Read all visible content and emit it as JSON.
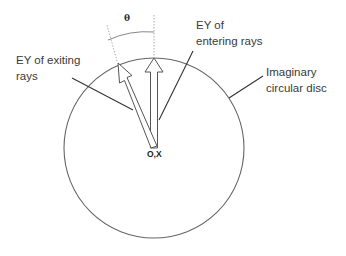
{
  "diagram": {
    "labels": {
      "exiting": [
        "EY of exiting",
        "rays"
      ],
      "entering": [
        "EY of",
        "entering rays"
      ],
      "disc": [
        "Imaginary",
        "circular disc"
      ],
      "angle": "θ",
      "origin": "O,X"
    },
    "colors": {
      "stroke": "#555555",
      "text": "#3a3a3a",
      "guide": "#9a9a9a",
      "background": "#ffffff"
    }
  }
}
